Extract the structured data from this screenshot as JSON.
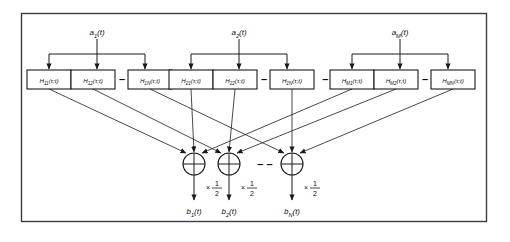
{
  "diagram": {
    "frame": {
      "border_color": "#3c3c46",
      "background": "#ffffff"
    },
    "line_color": "#1a1a1a",
    "inputs": [
      {
        "id": "a1",
        "label": "a₁(t)",
        "base": "a",
        "sub": "1",
        "arg": "(t)"
      },
      {
        "id": "a2",
        "label": "a₂(t)",
        "base": "a",
        "sub": "2",
        "arg": "(t)"
      },
      {
        "id": "aM",
        "label": "aₘ(t)",
        "base": "a",
        "sub": "M",
        "arg": "(t)"
      }
    ],
    "groups": [
      {
        "input_id": "a1",
        "blocks": [
          {
            "id": "H11",
            "base": "H",
            "sub": "11",
            "arg": "(τ;t)",
            "label": "H₁₁(τ;t)"
          },
          {
            "id": "H12",
            "base": "H",
            "sub": "12",
            "arg": "(τ;t)",
            "label": "H₁₂(τ;t)"
          },
          {
            "id": "H1N",
            "base": "H",
            "sub": "1N",
            "arg": "(τ;t)",
            "label": "H₁ₙ(τ;t)"
          }
        ],
        "inner_separator": "–"
      },
      {
        "input_id": "a2",
        "blocks": [
          {
            "id": "H21",
            "base": "H",
            "sub": "21",
            "arg": "(τ;t)",
            "label": "H₂₁(τ;t)"
          },
          {
            "id": "H22",
            "base": "H",
            "sub": "22",
            "arg": "(τ;t)",
            "label": "H₂₂(τ;t)"
          },
          {
            "id": "H2N",
            "base": "H",
            "sub": "2N",
            "arg": "(τ;t)",
            "label": "H₂ₙ(τ;t)"
          }
        ],
        "inner_separator": "–"
      },
      {
        "input_id": "aM",
        "blocks": [
          {
            "id": "HM1",
            "base": "H",
            "sub": "M1",
            "arg": "(τ;t)",
            "label": "Hₘ₁(τ;t)"
          },
          {
            "id": "HM2",
            "base": "H",
            "sub": "M2",
            "arg": "(τ;t)",
            "label": "Hₘ₂(τ;t)"
          },
          {
            "id": "HMN",
            "base": "H",
            "sub": "MN",
            "arg": "(τ;t)",
            "label": "Hₘₙ(τ;t)"
          }
        ],
        "inner_separator": "–"
      }
    ],
    "group_separator": "–  –",
    "summers": [
      {
        "id": "sum1",
        "symbol": "+",
        "gain": "×",
        "gain_num": "1",
        "gain_den": "2"
      },
      {
        "id": "sum2",
        "symbol": "+",
        "gain": "×",
        "gain_num": "1",
        "gain_den": "2"
      },
      {
        "id": "sumN",
        "symbol": "+",
        "gain": "×",
        "gain_num": "1",
        "gain_den": "2"
      }
    ],
    "summer_separator": "–  –",
    "outputs": [
      {
        "id": "b1",
        "base": "b",
        "sub": "1",
        "arg": "(t)",
        "label": "b₁(t)"
      },
      {
        "id": "b2",
        "base": "b",
        "sub": "2",
        "arg": "(t)",
        "label": "b₂(t)"
      },
      {
        "id": "bN",
        "base": "b",
        "sub": "N",
        "arg": "(t)",
        "label": "bₙ(t)"
      }
    ]
  }
}
